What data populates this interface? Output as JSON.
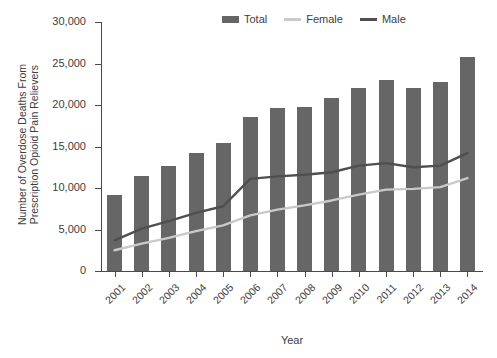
{
  "chart_data": {
    "type": "bar",
    "title": "",
    "xlabel": "Year",
    "ylabel_lines": [
      "Number of Overdose Deaths From",
      "Prescription Opioid Pain Relievers"
    ],
    "categories": [
      "2001",
      "2002",
      "2003",
      "2004",
      "2005",
      "2006",
      "2007",
      "2008",
      "2009",
      "2010",
      "2011",
      "2012",
      "2013",
      "2014"
    ],
    "ylim": [
      0,
      30000
    ],
    "ytick_labels": [
      "30,000",
      "25,000",
      "20,000",
      "15,000",
      "10,000",
      "5,000",
      "0"
    ],
    "ytick_values": [
      30000,
      25000,
      20000,
      15000,
      10000,
      5000,
      0
    ],
    "grid": false,
    "legend_position": "top-center",
    "series": [
      {
        "name": "Total",
        "render": "bar",
        "color": "#666666",
        "values": [
          9200,
          11500,
          12700,
          14200,
          15400,
          18500,
          19600,
          19800,
          20900,
          22100,
          23000,
          22100,
          22800,
          25800
        ]
      },
      {
        "name": "Female",
        "render": "line",
        "color": "#c9c9c9",
        "values": [
          2500,
          3300,
          4000,
          4800,
          5500,
          6700,
          7400,
          7900,
          8500,
          9200,
          9800,
          9900,
          10100,
          11200
        ]
      },
      {
        "name": "Male",
        "render": "line",
        "color": "#4f4f4f",
        "values": [
          3700,
          5100,
          6000,
          7000,
          7800,
          11100,
          11400,
          11600,
          11900,
          12700,
          13000,
          12500,
          12700,
          14200
        ]
      }
    ]
  }
}
